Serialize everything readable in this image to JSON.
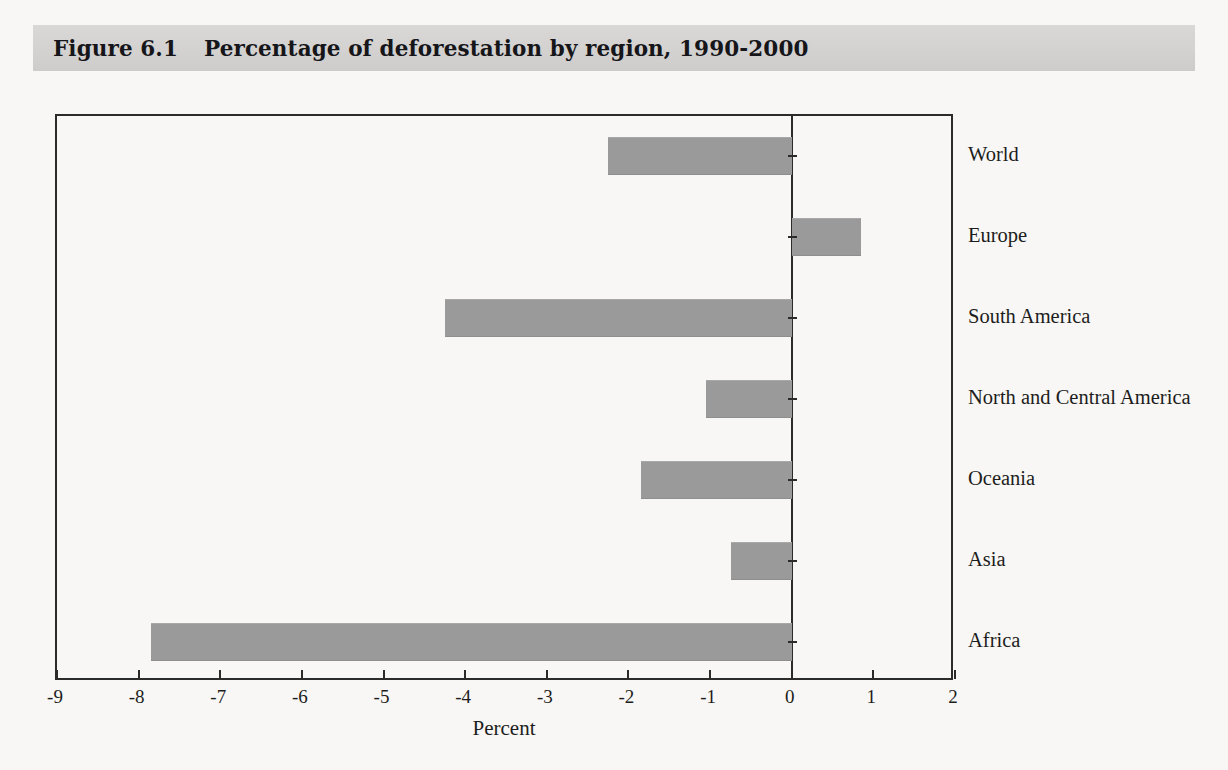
{
  "figure": {
    "label": "Figure 6.1",
    "title": "Percentage of deforestation by region, 1990-2000"
  },
  "colors": {
    "bar": "#9a9a9a",
    "axis": "#2b2b2b",
    "title_band": "#d3d2d0",
    "page_background": "#f8f7f5",
    "text": "#1d1d20"
  },
  "chart_data": {
    "type": "bar",
    "orientation": "horizontal",
    "title": "Percentage of deforestation by region, 1990-2000",
    "xlabel": "Percent",
    "ylabel": "",
    "xlim": [
      -9,
      2
    ],
    "xticks": [
      -9,
      -8,
      -7,
      -6,
      -5,
      -4,
      -3,
      -2,
      -1,
      0,
      1,
      2
    ],
    "xticklabels": [
      "-9",
      "-8",
      "-7",
      "-6",
      "-5",
      "-4",
      "-3",
      "-2",
      "-1",
      "0",
      "1",
      "2"
    ],
    "grid": false,
    "legend": false,
    "categories": [
      "World",
      "Europe",
      "South America",
      "North and Central America",
      "Oceania",
      "Asia",
      "Africa"
    ],
    "values": [
      -2.25,
      0.85,
      -4.25,
      -1.05,
      -1.85,
      -0.75,
      -7.85
    ],
    "series": [
      {
        "name": "Percentage change in forest area, 1990-2000",
        "values": [
          -2.25,
          0.85,
          -4.25,
          -1.05,
          -1.85,
          -0.75,
          -7.85
        ]
      }
    ]
  }
}
